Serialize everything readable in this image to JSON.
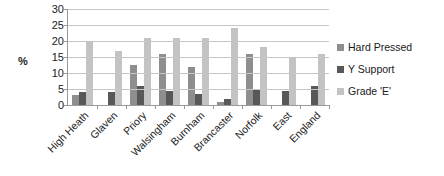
{
  "chart_data": {
    "type": "bar",
    "title": "",
    "xlabel": "",
    "ylabel": "%",
    "ylim": [
      0,
      30
    ],
    "ytick_step": 5,
    "yticks": [
      30,
      25,
      20,
      15,
      10,
      5,
      0
    ],
    "grid": true,
    "legend_position": "right",
    "categories": [
      "High Heath",
      "Glaven",
      "Priory",
      "Walsingham",
      "Burnham",
      "Brancaster",
      "Norfolk",
      "East",
      "England"
    ],
    "series": [
      {
        "name": "Hard Pressed",
        "color": "#8e8e8e",
        "values": [
          3,
          0,
          12.5,
          16,
          12,
          1,
          16,
          0,
          0
        ]
      },
      {
        "name": "Y Support",
        "color": "#585858",
        "values": [
          4,
          4,
          6,
          4.5,
          3.5,
          2,
          5,
          4.5,
          6
        ]
      },
      {
        "name": "Grade 'E'",
        "color": "#c3c3c3",
        "values": [
          20,
          17,
          21,
          21,
          21,
          24,
          18,
          15,
          16
        ]
      }
    ]
  }
}
